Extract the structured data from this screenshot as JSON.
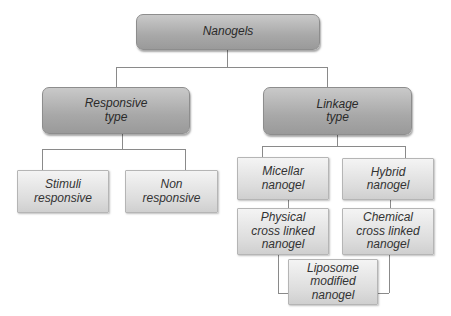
{
  "diagram": {
    "type": "hierarchy",
    "root": {
      "label": "Nanogels"
    },
    "level1": [
      {
        "label_line1": "Responsive",
        "label_line2": "type"
      },
      {
        "label_line1": "Linkage",
        "label_line2": "type"
      }
    ],
    "responsive_children": [
      {
        "label_line1": "Stimuli",
        "label_line2": "responsive"
      },
      {
        "label_line1": "Non",
        "label_line2": "responsive"
      }
    ],
    "linkage_children": [
      {
        "label_line1": "Micellar",
        "label_line2": "nanogel"
      },
      {
        "label_line1": "Hybrid",
        "label_line2": "nanogel"
      },
      {
        "label_line1": "Physical",
        "label_line2": "cross linked",
        "label_line3": "nanogel"
      },
      {
        "label_line1": "Chemical",
        "label_line2": "cross linked",
        "label_line3": "nanogel"
      },
      {
        "label_line1": "Liposome",
        "label_line2": "modified",
        "label_line3": "nanogel"
      }
    ],
    "colors": {
      "dark_box": "#a8a8a8",
      "light_box": "#e2e2e2",
      "connector": "#8a8a8a",
      "text": "#2a2a2a"
    }
  }
}
